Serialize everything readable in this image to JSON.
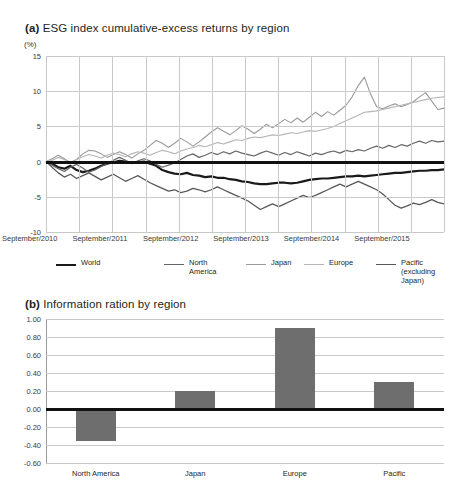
{
  "figure": {
    "panel_a": {
      "tag": "(a)",
      "title": "ESG index cumulative-excess returns by region",
      "unit": "(%)",
      "yticks": [
        "15",
        "10",
        "5",
        "0",
        "-5",
        "-10"
      ],
      "xticks": [
        "September/2010",
        "September/2011",
        "September/2012",
        "September/2013",
        "September/2014",
        "September/2015"
      ],
      "legend": [
        {
          "label": "World",
          "color": "#1a1a1a",
          "width": 2.2
        },
        {
          "label": "North\nAmerica",
          "color": "#666666",
          "width": 1.2
        },
        {
          "label": "Japan",
          "color": "#9a9a9a",
          "width": 1.1
        },
        {
          "label": "Europe",
          "color": "#b5b5b5",
          "width": 1.1
        },
        {
          "label": "Pacific (excluding Japan)",
          "color": "#585858",
          "width": 1.3
        }
      ]
    },
    "panel_b": {
      "tag": "(b)",
      "title": "Information ration by region",
      "yticks": [
        "1.00",
        "0.80",
        "0.60",
        "0.40",
        "0.20",
        "0.00",
        "-0.20",
        "-0.40",
        "-0.60"
      ],
      "bar_color": "#6e6e6e"
    }
  },
  "chart_data": [
    {
      "id": "panel-a",
      "type": "line",
      "title": "(a) ESG index cumulative-excess returns by region",
      "xlabel": "",
      "ylabel": "(%)",
      "ylim": [
        -10,
        15
      ],
      "ytick_values": [
        15,
        10,
        5,
        0,
        -5,
        -10
      ],
      "grid": true,
      "legend_position": "below",
      "x": [
        "September/2010",
        "September/2011",
        "September/2012",
        "September/2013",
        "September/2014",
        "September/2015"
      ],
      "x_index": [
        0,
        1,
        2,
        3,
        4,
        5,
        6,
        7,
        8,
        9,
        10,
        11,
        12,
        13,
        14,
        15,
        16,
        17,
        18,
        19,
        20,
        21,
        22,
        23,
        24,
        25,
        26,
        27,
        28,
        29,
        30,
        31,
        32,
        33,
        34,
        35,
        36,
        37,
        38,
        39,
        40,
        41,
        42,
        43,
        44,
        45,
        46,
        47,
        48,
        49,
        50,
        51,
        52,
        53,
        54,
        55,
        56,
        57,
        58,
        59,
        60,
        61,
        62,
        63,
        64,
        65
      ],
      "series": [
        {
          "name": "World",
          "color": "#1a1a1a",
          "width": 2.2,
          "values": [
            0.0,
            -0.3,
            -0.8,
            -1.0,
            -0.6,
            -1.2,
            -1.5,
            -1.3,
            -1.0,
            -0.6,
            -0.3,
            -0.1,
            0.1,
            0.0,
            -0.2,
            -0.1,
            0.0,
            -0.3,
            -0.6,
            -1.2,
            -1.5,
            -1.7,
            -1.8,
            -1.6,
            -1.9,
            -2.0,
            -2.2,
            -2.1,
            -2.3,
            -2.3,
            -2.5,
            -2.6,
            -2.8,
            -2.9,
            -3.1,
            -3.2,
            -3.2,
            -3.1,
            -3.0,
            -3.0,
            -3.1,
            -3.0,
            -2.8,
            -2.6,
            -2.5,
            -2.4,
            -2.4,
            -2.3,
            -2.2,
            -2.1,
            -2.1,
            -2.0,
            -2.1,
            -2.0,
            -1.9,
            -1.8,
            -1.7,
            -1.6,
            -1.6,
            -1.5,
            -1.4,
            -1.3,
            -1.3,
            -1.2,
            -1.2,
            -1.1
          ]
        },
        {
          "name": "North America",
          "color": "#666666",
          "width": 1.2,
          "values": [
            0.0,
            -0.5,
            -1.0,
            -1.4,
            -0.8,
            -0.4,
            -0.9,
            -1.5,
            -1.2,
            -0.7,
            -0.3,
            0.2,
            0.6,
            0.2,
            -0.3,
            0.1,
            0.4,
            0.1,
            -0.4,
            -0.8,
            -0.5,
            -0.2,
            0.3,
            0.8,
            1.1,
            0.6,
            0.9,
            1.3,
            1.0,
            1.4,
            1.1,
            1.5,
            1.2,
            1.0,
            0.8,
            1.2,
            1.5,
            1.2,
            0.9,
            1.3,
            1.0,
            1.4,
            1.1,
            0.8,
            1.2,
            1.0,
            1.3,
            1.5,
            1.2,
            1.6,
            1.4,
            1.7,
            1.5,
            1.9,
            2.2,
            1.9,
            2.3,
            2.0,
            2.4,
            2.2,
            2.6,
            2.9,
            2.6,
            3.0,
            2.8,
            2.9
          ]
        },
        {
          "name": "Japan",
          "color": "#9a9a9a",
          "width": 1.1,
          "values": [
            0.0,
            0.4,
            0.9,
            0.4,
            -0.2,
            0.3,
            1.1,
            1.6,
            1.5,
            1.1,
            0.6,
            1.0,
            1.4,
            1.0,
            0.5,
            1.1,
            1.6,
            2.3,
            3.0,
            2.6,
            2.0,
            2.6,
            3.3,
            2.8,
            2.2,
            2.8,
            3.5,
            4.2,
            4.8,
            4.3,
            3.8,
            4.4,
            5.1,
            4.6,
            4.0,
            4.6,
            5.3,
            4.8,
            5.4,
            6.0,
            5.5,
            6.2,
            5.6,
            6.3,
            7.0,
            6.4,
            7.1,
            6.6,
            7.3,
            8.0,
            9.2,
            10.8,
            12.0,
            9.6,
            7.8,
            7.5,
            7.9,
            8.2,
            7.8,
            8.1,
            8.5,
            9.2,
            9.8,
            8.6,
            7.4,
            7.6
          ]
        },
        {
          "name": "Europe",
          "color": "#b5b5b5",
          "width": 1.1,
          "values": [
            0.0,
            0.2,
            0.6,
            0.3,
            -0.1,
            0.3,
            0.7,
            1.0,
            0.8,
            0.5,
            0.9,
            1.2,
            1.0,
            0.7,
            1.1,
            1.4,
            1.2,
            0.9,
            1.3,
            1.6,
            1.4,
            1.1,
            1.5,
            1.8,
            2.0,
            2.3,
            2.1,
            2.4,
            2.7,
            2.5,
            2.8,
            3.1,
            3.0,
            3.3,
            3.5,
            3.4,
            3.6,
            3.8,
            3.7,
            3.9,
            4.1,
            4.0,
            4.2,
            4.4,
            4.3,
            4.5,
            4.7,
            5.0,
            5.4,
            5.8,
            6.2,
            6.6,
            7.0,
            7.1,
            7.2,
            7.4,
            7.6,
            7.8,
            8.0,
            8.2,
            8.4,
            8.6,
            8.8,
            9.0,
            9.1,
            9.2
          ]
        },
        {
          "name": "Pacific (excluding Japan)",
          "color": "#585858",
          "width": 1.3,
          "values": [
            0.0,
            -0.8,
            -1.6,
            -2.2,
            -1.8,
            -2.4,
            -2.0,
            -1.6,
            -2.1,
            -2.6,
            -2.2,
            -1.8,
            -2.3,
            -2.8,
            -2.4,
            -2.0,
            -2.5,
            -3.0,
            -3.4,
            -3.8,
            -4.2,
            -4.0,
            -4.4,
            -4.2,
            -3.8,
            -4.0,
            -4.3,
            -4.0,
            -3.6,
            -4.0,
            -4.4,
            -4.8,
            -5.2,
            -5.6,
            -6.2,
            -6.8,
            -6.4,
            -6.0,
            -6.4,
            -6.0,
            -5.6,
            -5.2,
            -4.8,
            -5.1,
            -4.8,
            -4.4,
            -4.0,
            -3.6,
            -3.2,
            -3.6,
            -3.2,
            -2.8,
            -3.2,
            -3.6,
            -4.0,
            -4.6,
            -5.4,
            -6.2,
            -6.6,
            -6.3,
            -5.9,
            -6.1,
            -5.8,
            -5.4,
            -5.8,
            -6.0
          ]
        }
      ]
    },
    {
      "id": "panel-b",
      "type": "bar",
      "title": "(b) Information ration by region",
      "xlabel": "",
      "ylabel": "",
      "ylim": [
        -0.6,
        1.0
      ],
      "ytick_values": [
        1.0,
        0.8,
        0.6,
        0.4,
        0.2,
        0.0,
        -0.2,
        -0.4,
        -0.6
      ],
      "grid": true,
      "categories": [
        "North America",
        "Japan",
        "Europe",
        "Pacific"
      ],
      "values": [
        -0.36,
        0.2,
        0.9,
        0.3
      ],
      "bar_color": "#6e6e6e"
    }
  ]
}
